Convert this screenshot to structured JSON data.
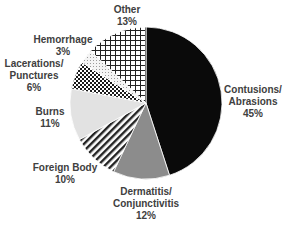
{
  "chart_data": {
    "type": "pie",
    "title": "",
    "start_angle_deg": 0,
    "direction": "clockwise",
    "slices": [
      {
        "label": "Contusions/ Abrasions",
        "value": 45,
        "pct_label": "45%",
        "pattern": "solid-black"
      },
      {
        "label": "Dermatitis/ Conjunctivitis",
        "value": 12,
        "pct_label": "12%",
        "pattern": "solid-gray"
      },
      {
        "label": "Foreign Body",
        "value": 10,
        "pct_label": "10%",
        "pattern": "diagonal-stripes"
      },
      {
        "label": "Burns",
        "value": 11,
        "pct_label": "11%",
        "pattern": "light-gray"
      },
      {
        "label": "Lacerations/ Punctures",
        "value": 6,
        "pct_label": "6%",
        "pattern": "checkerboard"
      },
      {
        "label": "Hemorrhage",
        "value": 3,
        "pct_label": "3%",
        "pattern": "light-dots"
      },
      {
        "label": "Other",
        "value": 13,
        "pct_label": "13%",
        "pattern": "grid"
      }
    ],
    "legend": "none (data labels outside slices)"
  },
  "labels": {
    "contusions": {
      "line1": "Contusions/",
      "line2": "Abrasions",
      "pct": "45%"
    },
    "dermatitis": {
      "line1": "Dermatitis/",
      "line2": "Conjunctivitis",
      "pct": "12%"
    },
    "foreign_body": {
      "line1": "Foreign Body",
      "pct": "10%"
    },
    "burns": {
      "line1": "Burns",
      "pct": "11%"
    },
    "lacerations": {
      "line1": "Lacerations/",
      "line2": "Punctures",
      "pct": "6%"
    },
    "hemorrhage": {
      "line1": "Hemorrhage",
      "pct": "3%"
    },
    "other": {
      "line1": "Other",
      "pct": "13%"
    }
  },
  "colors": {
    "contusions": "#0a0a0a",
    "dermatitis": "#8c8c8c",
    "burns": "#e2e2e2",
    "stroke": "#ffffff",
    "text": "#404040"
  }
}
